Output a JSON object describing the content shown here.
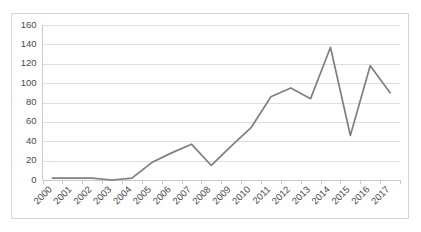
{
  "chart_data": {
    "type": "line",
    "title": "",
    "subtitle": "",
    "xlabel": "",
    "ylabel": "",
    "categories": [
      "2000",
      "2001",
      "2002",
      "2003",
      "2004",
      "2005",
      "2006",
      "2007",
      "2008",
      "2009",
      "2010",
      "2011",
      "2012",
      "2013",
      "2014",
      "2015",
      "2016",
      "2017"
    ],
    "values": [
      2,
      2,
      2,
      0,
      2,
      18,
      28,
      37,
      15,
      35,
      54,
      86,
      95,
      84,
      137,
      46,
      118,
      90
    ],
    "series": [
      {
        "name": "",
        "values": [
          2,
          2,
          2,
          0,
          2,
          18,
          28,
          37,
          15,
          35,
          54,
          86,
          95,
          84,
          137,
          46,
          118,
          90
        ]
      }
    ],
    "ylim": [
      0,
      160
    ],
    "ytick_values": [
      0,
      20,
      40,
      60,
      80,
      100,
      120,
      140,
      160
    ],
    "ytick_labels": [
      "0",
      "20",
      "40",
      "60",
      "80",
      "100",
      "120",
      "140",
      "160"
    ],
    "xtick_labels": [
      "2000",
      "2001",
      "2002",
      "2003",
      "2004",
      "2005",
      "2006",
      "2007",
      "2008",
      "2009",
      "2010",
      "2011",
      "2012",
      "2013",
      "2014",
      "2015",
      "2016",
      "2017"
    ],
    "grid": "horizontal",
    "legend": "none",
    "annotations": [],
    "colors": {
      "series_line": "#7f7f7f",
      "gridline": "#dedede",
      "axis": "#c9c9c9",
      "tick_text": "#4a4a4a",
      "plot_background": "#ffffff",
      "frame_border": "#d4d4d4"
    },
    "xlabel_rotation_degrees": -45
  }
}
